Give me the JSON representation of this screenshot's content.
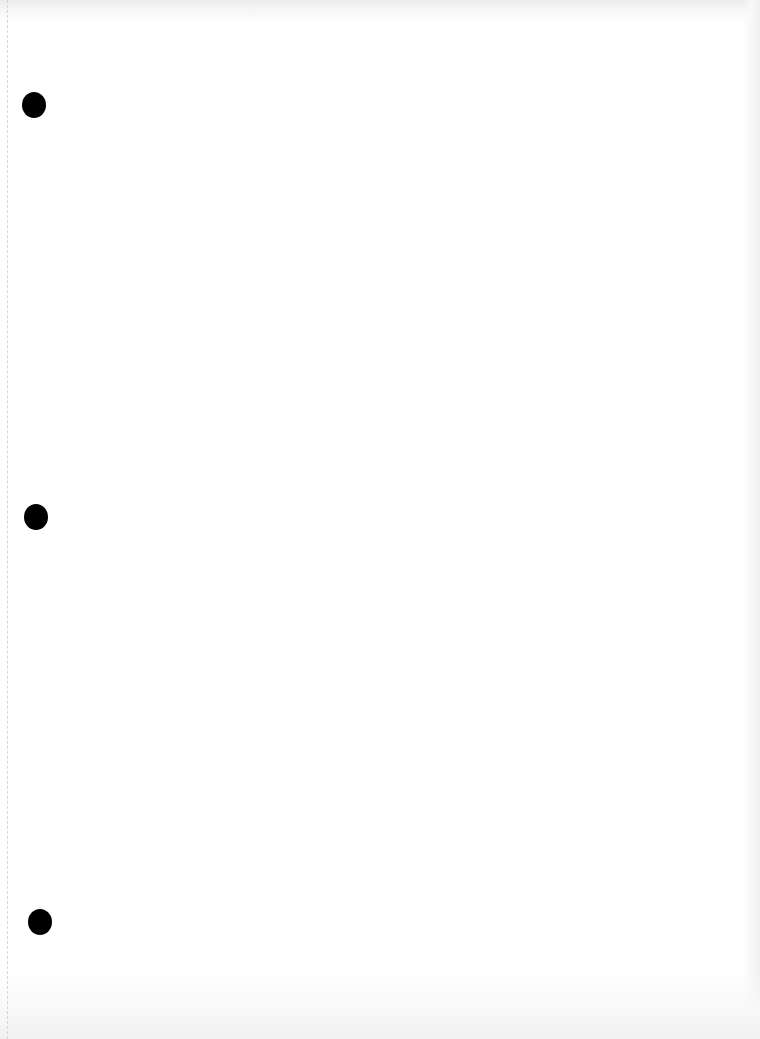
{
  "document": {
    "type": "scanned blank page",
    "content_text": "",
    "background_color": "#ffffff",
    "punch_holes": [
      {
        "name": "top",
        "x": 22,
        "y": 92
      },
      {
        "name": "middle",
        "x": 24,
        "y": 504
      },
      {
        "name": "bottom",
        "x": 28,
        "y": 909
      }
    ],
    "hole_color": "#000000"
  }
}
